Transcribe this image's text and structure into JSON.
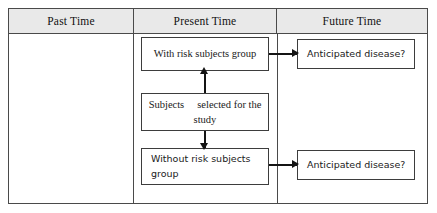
{
  "diagram": {
    "type": "cohort-study-flow-diagram",
    "columns": [
      {
        "id": "past",
        "header": "Past Time"
      },
      {
        "id": "present",
        "header": "Present Time"
      },
      {
        "id": "future",
        "header": "Future Time"
      }
    ],
    "nodes": {
      "subjects": {
        "word_1": "Subjects",
        "word_rest": "selected for the study",
        "full_text": "Subjects   selected for the study",
        "column": "present"
      },
      "with_risk": {
        "label": "With risk subjects group",
        "column": "present"
      },
      "without_risk": {
        "line_1": "Without risk subjects",
        "line_2": "group",
        "full_text": "Without risk subjects group",
        "column": "present"
      },
      "disease_top": {
        "label": "Anticipated disease?",
        "column": "future"
      },
      "disease_bottom": {
        "label": "Anticipated disease?",
        "column": "future"
      }
    },
    "connectors": [
      {
        "from": "subjects",
        "to": "with_risk",
        "direction": "up"
      },
      {
        "from": "subjects",
        "to": "without_risk",
        "direction": "down"
      },
      {
        "from": "with_risk",
        "to": "disease_top",
        "direction": "right"
      },
      {
        "from": "without_risk",
        "to": "disease_bottom",
        "direction": "right"
      }
    ],
    "colors": {
      "border": "#4a4a4a",
      "box_border": "#3d3d3d",
      "header_fill": "#e9e9e9",
      "background": "#ffffff",
      "connector": "#141414",
      "text": "#1a1a1a"
    }
  }
}
